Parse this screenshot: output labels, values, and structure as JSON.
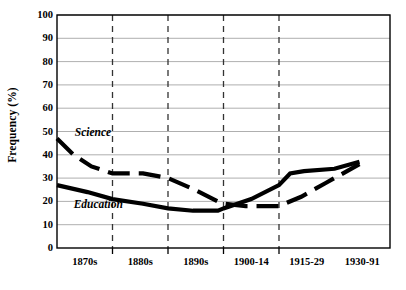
{
  "chart_data": {
    "type": "line",
    "title": "",
    "xlabel": "",
    "ylabel": "Frequency (%)",
    "ylim": [
      0,
      100
    ],
    "yticks": [
      0,
      10,
      20,
      30,
      40,
      50,
      60,
      70,
      80,
      90,
      100
    ],
    "ytick_labels": [
      "0",
      "10",
      "20",
      "30",
      "40",
      "50",
      "60",
      "70",
      "80",
      "90",
      "100"
    ],
    "categories": [
      "1870s",
      "1880s",
      "1890s",
      "1900-14",
      "1915-29",
      "1930-91"
    ],
    "grid": {
      "horizontal": true,
      "vertical_dashed": true,
      "vertical_count": 4
    },
    "legend": {
      "position": "inline-annotations"
    },
    "series": [
      {
        "name": "Science",
        "style": "dashed",
        "color": "#000000",
        "label_text": "Science",
        "values": [
          47,
          35,
          31,
          19,
          18,
          36
        ],
        "points": [
          {
            "x": 0.0,
            "y": 47
          },
          {
            "x": 0.3,
            "y": 40
          },
          {
            "x": 0.62,
            "y": 35
          },
          {
            "x": 1.0,
            "y": 32
          },
          {
            "x": 1.55,
            "y": 32
          },
          {
            "x": 2.0,
            "y": 30
          },
          {
            "x": 2.48,
            "y": 25
          },
          {
            "x": 2.9,
            "y": 20
          },
          {
            "x": 3.0,
            "y": 19
          },
          {
            "x": 3.4,
            "y": 18
          },
          {
            "x": 4.0,
            "y": 18
          },
          {
            "x": 4.4,
            "y": 22
          },
          {
            "x": 4.85,
            "y": 28
          },
          {
            "x": 5.0,
            "y": 30
          },
          {
            "x": 5.45,
            "y": 36
          }
        ]
      },
      {
        "name": "Education",
        "style": "solid",
        "color": "#000000",
        "label_text": "Education",
        "values": [
          27,
          20,
          16,
          21,
          33,
          37
        ],
        "points": [
          {
            "x": 0.0,
            "y": 27
          },
          {
            "x": 0.55,
            "y": 24
          },
          {
            "x": 1.0,
            "y": 21
          },
          {
            "x": 1.55,
            "y": 19
          },
          {
            "x": 2.0,
            "y": 17
          },
          {
            "x": 2.45,
            "y": 16
          },
          {
            "x": 2.9,
            "y": 16
          },
          {
            "x": 3.0,
            "y": 17
          },
          {
            "x": 3.5,
            "y": 21
          },
          {
            "x": 4.0,
            "y": 27
          },
          {
            "x": 4.2,
            "y": 32
          },
          {
            "x": 4.45,
            "y": 33
          },
          {
            "x": 5.0,
            "y": 34
          },
          {
            "x": 5.45,
            "y": 37
          }
        ]
      }
    ],
    "annotations": [
      {
        "name": "science-label",
        "text": "Science",
        "x": 0.32,
        "y": 48
      },
      {
        "name": "education-label",
        "text": "Education",
        "x": 0.3,
        "y": 17
      }
    ],
    "colors": {
      "axis": "#000000",
      "gridline": "#9a9a9a",
      "vertical_gridline": "#333333",
      "background": "#ffffff",
      "series": "#000000"
    }
  }
}
